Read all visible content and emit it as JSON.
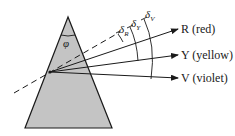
{
  "diagram": {
    "type": "prism-dispersion",
    "prism": {
      "apex_angle_label": "φ",
      "fill": "#c4c4c4",
      "stroke": "#1a1a1a"
    },
    "incident_ray": {
      "style": "dashed",
      "color": "#1a1a1a"
    },
    "rays": [
      {
        "id": "R",
        "label": "R (red)",
        "deviation_symbol": "δ",
        "deviation_sub": "R"
      },
      {
        "id": "Y",
        "label": "Y (yellow)",
        "deviation_symbol": "δ",
        "deviation_sub": "Y"
      },
      {
        "id": "V",
        "label": "V (violet)",
        "deviation_symbol": "δ",
        "deviation_sub": "V"
      }
    ]
  }
}
